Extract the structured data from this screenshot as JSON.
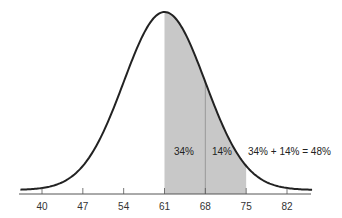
{
  "chart_data": {
    "type": "area",
    "title": "",
    "xlabel": "",
    "ylabel": "",
    "distribution": "normal",
    "mean": 61,
    "std_dev": 7,
    "xlim": [
      36.5,
      86
    ],
    "x_ticks": [
      40,
      47,
      54,
      61,
      68,
      75,
      82
    ],
    "shaded_regions": [
      {
        "from": 61,
        "to": 68,
        "label": "34%",
        "percent": 34
      },
      {
        "from": 68,
        "to": 75,
        "label": "14%",
        "percent": 14
      }
    ],
    "annotations": [
      {
        "text": "34% + 14% = 48%",
        "x": 75,
        "position": "right of shaded area"
      }
    ],
    "grid": false,
    "legend": null
  },
  "colors": {
    "curve": "#222222",
    "shade": "#c8c8c8",
    "axis": "#555555",
    "divider": "#888888"
  },
  "labels": {
    "region1": "34%",
    "region2": "14%",
    "sum": "34% + 14% = 48%",
    "ticks": [
      "40",
      "47",
      "54",
      "61",
      "68",
      "75",
      "82"
    ]
  }
}
